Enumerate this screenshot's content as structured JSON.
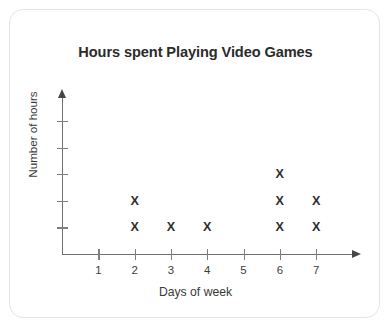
{
  "card": {
    "background_color": "#ffffff",
    "border_color": "#e3e5e7"
  },
  "chart_data": {
    "type": "scatter",
    "plot_style": "dot-plot-x-marks",
    "title": "Hours spent Playing Video Games",
    "xlabel": "Days of week",
    "ylabel": "Number of hours",
    "categories": [
      "1",
      "2",
      "3",
      "4",
      "5",
      "6",
      "7"
    ],
    "values": [
      0,
      2,
      1,
      1,
      0,
      3,
      2
    ],
    "x": [
      1,
      2,
      3,
      4,
      5,
      6,
      7
    ],
    "xlim": [
      0,
      8
    ],
    "ylim": [
      0,
      5
    ],
    "y_tick_count": 5,
    "y_tick_labels": [
      "",
      "",
      "",
      "",
      ""
    ],
    "x_tick_labels": [
      "1",
      "2",
      "3",
      "4",
      "5",
      "6",
      "7"
    ],
    "grid": false,
    "legend": false,
    "marker": "X",
    "marker_color": "#2e2e2e",
    "axis_color": "#6e7173",
    "points": [
      {
        "x": 2,
        "y": 1
      },
      {
        "x": 2,
        "y": 2
      },
      {
        "x": 3,
        "y": 1
      },
      {
        "x": 4,
        "y": 1
      },
      {
        "x": 6,
        "y": 1
      },
      {
        "x": 6,
        "y": 2
      },
      {
        "x": 6,
        "y": 3
      },
      {
        "x": 7,
        "y": 1
      },
      {
        "x": 7,
        "y": 2
      }
    ]
  }
}
